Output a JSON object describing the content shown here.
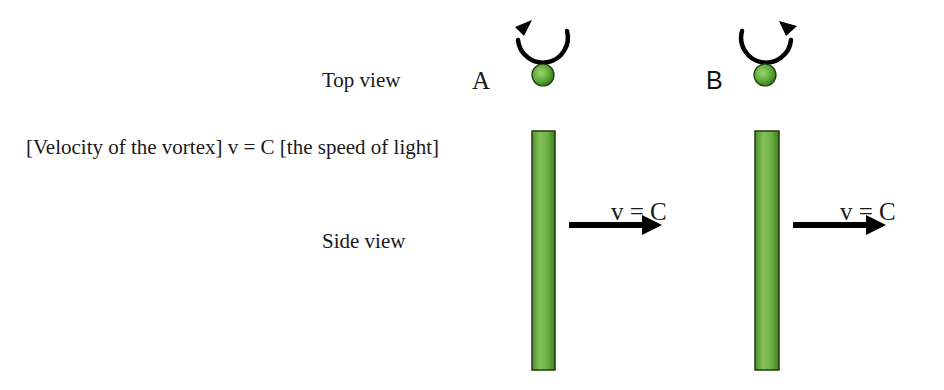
{
  "labels": {
    "top_view": "Top view",
    "side_view": "Side view",
    "caption": "[Velocity of the vortex] v = C [the speed of light]"
  },
  "vortices": [
    {
      "id": "A",
      "label": "A",
      "rotation": "counterclockwise-arrow-left",
      "velocity_label": "v = C"
    },
    {
      "id": "B",
      "label": "B",
      "rotation": "clockwise-arrow-right",
      "velocity_label": "v = C"
    }
  ],
  "colors": {
    "bar_fill": "#6db043",
    "bar_edge": "#1f3a12",
    "ball_fill": "#5fae3a",
    "arrow": "#000000"
  }
}
